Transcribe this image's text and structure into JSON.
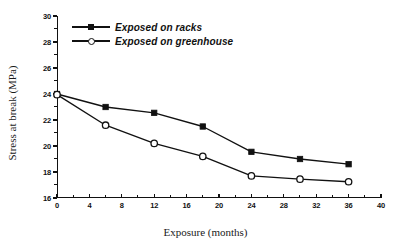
{
  "chart_data": {
    "type": "line",
    "title": "",
    "xlabel": "Exposure (months)",
    "ylabel": "Stress at break (MPa)",
    "xlim": [
      0,
      40
    ],
    "ylim": [
      16,
      30
    ],
    "xticks": [
      0,
      4,
      8,
      12,
      16,
      20,
      24,
      28,
      32,
      36,
      40
    ],
    "yticks": [
      16,
      18,
      20,
      22,
      24,
      26,
      28,
      30
    ],
    "xtick_labels": [
      "0",
      "4",
      "8",
      "12",
      "16",
      "20",
      "24",
      "28",
      "32",
      "36",
      "40"
    ],
    "ytick_labels": [
      "16",
      "18",
      "20",
      "22",
      "24",
      "26",
      "28",
      "30"
    ],
    "x_minor_step": 2,
    "y_minor_step": 1,
    "grid": false,
    "legend_position": "upper-left",
    "x": [
      0,
      6,
      12,
      18,
      24,
      30,
      36
    ],
    "series": [
      {
        "name": "Exposed on racks",
        "marker": "filled-square",
        "color": "#111111",
        "values": [
          24.0,
          23.0,
          22.55,
          21.5,
          19.55,
          19.0,
          18.6
        ]
      },
      {
        "name": "Exposed on greenhouse",
        "marker": "open-circle",
        "color": "#111111",
        "values": [
          23.95,
          21.6,
          20.2,
          19.2,
          17.7,
          17.45,
          17.25
        ]
      }
    ]
  },
  "legend": {
    "items": [
      {
        "label": "Exposed on racks",
        "marker": "filled-square"
      },
      {
        "label": "Exposed on greenhouse",
        "marker": "open-circle"
      }
    ]
  },
  "axes": {
    "x_title": "Exposure (months)",
    "y_title": "Stress at break (MPa)"
  }
}
